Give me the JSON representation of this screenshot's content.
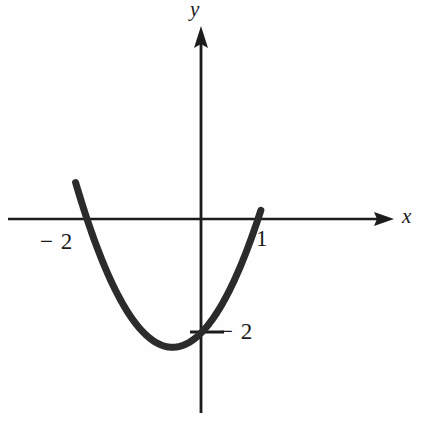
{
  "figure": {
    "kind": "cartesian-graph",
    "background_color": "#fefefe",
    "ink_color": "#1c1c1c",
    "curve_color": "#2b2b2b"
  },
  "axes": {
    "x_label": "x",
    "y_label": "y",
    "x_axis": {
      "arrow": "right",
      "y_pixel": 219,
      "x_start_pixel": 8,
      "x_end_pixel": 394
    },
    "y_axis": {
      "arrow": "up",
      "x_pixel": 201,
      "y_start_pixel": 26,
      "y_end_pixel": 413
    },
    "origin_pixel": {
      "x": 201,
      "y": 219
    },
    "units_per_pixel": {
      "x": 57,
      "y": 57
    }
  },
  "ticks": [
    {
      "name": "x-root-negative-two",
      "label": "− 2",
      "axis": "x",
      "value": -2,
      "pixel": {
        "x": 87,
        "y": 219
      },
      "drawn_mark": false
    },
    {
      "name": "x-root-one",
      "label": "1",
      "axis": "x",
      "value": 1,
      "pixel": {
        "x": 250,
        "y": 219
      },
      "drawn_mark": false
    },
    {
      "name": "y-minus-two",
      "label": "− 2",
      "axis": "y",
      "value": -2,
      "pixel": {
        "x": 201,
        "y": 332
      },
      "drawn_mark": true
    }
  ],
  "chart_data": {
    "type": "line",
    "title": "",
    "subtitle": "",
    "xlabel": "x",
    "ylabel": "y",
    "xlim": [
      -3.4,
      3.4
    ],
    "ylim": [
      -3.4,
      3.4
    ],
    "grid": false,
    "legend": null,
    "axis_style": "arrowed-cartesian-axes-through-origin",
    "xticks": [
      -2,
      1
    ],
    "xticklabels": [
      "− 2",
      "1"
    ],
    "yticks": [
      -2
    ],
    "yticklabels": [
      "− 2"
    ],
    "series": [
      {
        "name": "parabola",
        "kind": "quadratic",
        "equation": "y = (x + 2)(x - 1)",
        "roots": [
          -2,
          1
        ],
        "vertex": [
          -0.5,
          -2.25
        ],
        "opens": "upward",
        "linewidth_px": 7,
        "color": "#2b2b2b",
        "x_domain": [
          -2.2,
          1.05
        ],
        "x": [
          -2.18,
          -2.0,
          -1.75,
          -1.5,
          -1.25,
          -1.0,
          -0.75,
          -0.5,
          -0.25,
          0.0,
          0.25,
          0.5,
          0.75,
          1.0
        ],
        "y": [
          -0.21,
          0.0,
          -0.94,
          -1.75,
          -2.19,
          -2.0,
          -2.19,
          -2.25,
          -2.19,
          -2.0,
          -1.69,
          -1.25,
          -0.69,
          0.0
        ]
      }
    ],
    "annotations": [
      {
        "text": "− 2",
        "x": -2,
        "y": -0.35,
        "role": "x-intercept-label"
      },
      {
        "text": "1",
        "x": 1.05,
        "y": -0.32,
        "role": "x-intercept-label"
      },
      {
        "text": "− 2",
        "x": 0.45,
        "y": -2.03,
        "role": "y-value-label"
      }
    ]
  }
}
